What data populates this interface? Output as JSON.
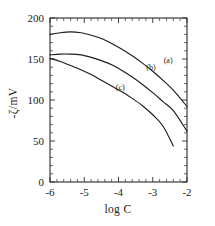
{
  "chart_data": {
    "type": "line",
    "title": "",
    "subtitle": "",
    "xlabel": "log C",
    "ylabel": "-ζ/mV",
    "xlim": [
      -6,
      -2
    ],
    "ylim": [
      0,
      200
    ],
    "grid": false,
    "legend_position": "inline-annotations",
    "xticks": [
      -6,
      -5,
      -4,
      -3,
      -2
    ],
    "xtick_labels": [
      "-6",
      "-5",
      "-4",
      "-3",
      "-2"
    ],
    "xminor_ticks": [
      -5.8,
      -5.6,
      -5.4,
      -5.2,
      -4.8,
      -4.6,
      -4.4,
      -4.2,
      -3.8,
      -3.6,
      -3.4,
      -3.2,
      -2.8,
      -2.6,
      -2.4,
      -2.2
    ],
    "yticks": [
      0,
      50,
      100,
      150,
      200
    ],
    "ytick_labels": [
      "0",
      "50",
      "100",
      "150",
      "200"
    ],
    "yminor_ticks": [
      10,
      20,
      30,
      40,
      60,
      70,
      80,
      90,
      110,
      120,
      130,
      140,
      160,
      170,
      180,
      190
    ],
    "series": [
      {
        "name": "(a)",
        "label": "(a)",
        "annotation": "(a)",
        "annotation_x": -2.55,
        "annotation_y": 145,
        "x": [
          -6.0,
          -5.7,
          -5.4,
          -5.1,
          -4.8,
          -4.5,
          -4.2,
          -3.9,
          -3.6,
          -3.3,
          -3.0,
          -2.7,
          -2.4,
          -2.0
        ],
        "y": [
          180,
          182,
          183,
          182,
          179,
          175,
          169,
          162,
          154,
          145,
          135,
          124,
          112,
          92
        ]
      },
      {
        "name": "(b)",
        "label": "(b)",
        "annotation": "(b)",
        "annotation_x": -3.05,
        "annotation_y": 137,
        "x": [
          -6.0,
          -5.7,
          -5.4,
          -5.1,
          -4.8,
          -4.5,
          -4.2,
          -3.9,
          -3.6,
          -3.3,
          -3.0,
          -2.7,
          -2.4,
          -2.0
        ],
        "y": [
          155,
          156,
          156,
          155,
          152,
          148,
          143,
          136,
          128,
          119,
          109,
          98,
          87,
          62
        ]
      },
      {
        "name": "(c)",
        "label": "(c)",
        "annotation": "(c)",
        "annotation_x": -3.95,
        "annotation_y": 112,
        "x": [
          -6.0,
          -5.7,
          -5.4,
          -5.1,
          -4.8,
          -4.5,
          -4.2,
          -3.9,
          -3.6,
          -3.3,
          -3.0,
          -2.7,
          -2.4
        ],
        "y": [
          151,
          147,
          142,
          137,
          131,
          124,
          117,
          110,
          102,
          93,
          82,
          68,
          44
        ]
      }
    ],
    "axis_color": "#2b2b2b",
    "curve_color": "#1c1c1c",
    "background_color": "#ffffff"
  }
}
